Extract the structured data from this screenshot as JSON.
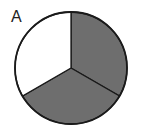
{
  "figure": {
    "label": "A",
    "parts_total": 3,
    "parts_shaded": 2,
    "colors": {
      "shaded": "#6e6e6e",
      "unshaded": "#ffffff",
      "outline": "#1a1a1a"
    }
  }
}
